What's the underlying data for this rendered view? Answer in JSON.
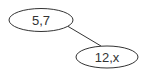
{
  "diagram": {
    "type": "tree",
    "nodes": [
      {
        "id": "n1",
        "label": "5,7",
        "cx": 41,
        "cy": 20,
        "rx": 32,
        "ry": 11.5
      },
      {
        "id": "n2",
        "label": "12,x",
        "cx": 107,
        "cy": 57,
        "rx": 31,
        "ry": 11
      }
    ],
    "edges": [
      {
        "from": "n1",
        "to": "n2",
        "x1": 64,
        "y1": 24,
        "x2": 101,
        "y2": 46
      }
    ],
    "colors": {
      "stroke": "#333333",
      "text": "#333333",
      "background": "#ffffff"
    }
  }
}
